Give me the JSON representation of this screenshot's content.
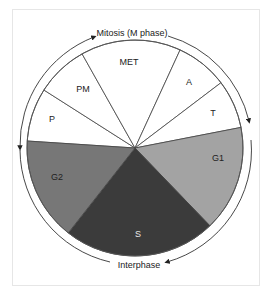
{
  "diagram": {
    "top_caption": "Mitosis (M phase)",
    "bottom_caption": "Interphase",
    "center": [
      135,
      148
    ],
    "radius": 108,
    "sectors": [
      {
        "id": "P",
        "label": "P",
        "fill": "#ffffff",
        "from": [
          27,
          141
        ],
        "to": [
          44,
          90
        ],
        "label_pos": [
          52,
          122
        ]
      },
      {
        "id": "PM",
        "label": "PM",
        "fill": "#ffffff",
        "from": [
          44,
          90
        ],
        "to": [
          81,
          52
        ],
        "label_pos": [
          83,
          92
        ]
      },
      {
        "id": "MET",
        "label": "MET",
        "fill": "#ffffff",
        "from": [
          81,
          52
        ],
        "to": [
          181,
          48
        ],
        "label_pos": [
          129,
          65
        ]
      },
      {
        "id": "A",
        "label": "A",
        "fill": "#ffffff",
        "from": [
          181,
          48
        ],
        "to": [
          222,
          82
        ],
        "label_pos": [
          189,
          85
        ]
      },
      {
        "id": "T",
        "label": "T",
        "fill": "#ffffff",
        "from": [
          222,
          82
        ],
        "to": [
          243,
          127
        ],
        "label_pos": [
          213,
          116
        ]
      },
      {
        "id": "G1",
        "label": "G1",
        "fill": "#a3a3a3",
        "from": [
          243,
          127
        ],
        "to": [
          211,
          227
        ],
        "label_pos": [
          218,
          161
        ]
      },
      {
        "id": "S",
        "label": "S",
        "fill": "#3b3b3b",
        "from": [
          211,
          227
        ],
        "to": [
          69,
          232
        ],
        "label_pos": [
          138,
          237
        ]
      },
      {
        "id": "G2",
        "label": "G2",
        "fill": "#777777",
        "from": [
          69,
          232
        ],
        "to": [
          27,
          141
        ],
        "label_pos": [
          57,
          180
        ]
      }
    ]
  }
}
